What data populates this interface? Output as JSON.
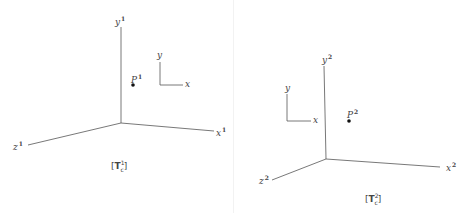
{
  "diagrams": [
    {
      "id": "left",
      "axis_labels": {
        "y": "y",
        "x": "x",
        "z": "z",
        "point": "P"
      },
      "superscript": "1",
      "small_axes": {
        "y": "y",
        "x": "x"
      },
      "caption": {
        "matrix": "T",
        "superscript": "1",
        "subscript": "c"
      }
    },
    {
      "id": "right",
      "axis_labels": {
        "y": "y",
        "x": "x",
        "z": "z",
        "point": "P"
      },
      "superscript": "2",
      "small_axes": {
        "y": "y",
        "x": "x"
      },
      "caption": {
        "matrix": "T",
        "superscript": "2",
        "subscript": "c"
      }
    }
  ],
  "colors": {
    "line": "#555555",
    "point": "#111111",
    "text": "#444444"
  }
}
